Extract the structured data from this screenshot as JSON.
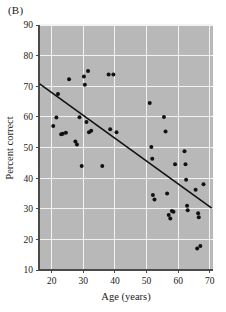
{
  "figure": {
    "panel_label": "(B)",
    "background_color": "#ffffff",
    "plot_background_color": "#b8b8b8",
    "grid_color": "#f2f2f2",
    "point_color": "#111111",
    "line_color": "#111111"
  },
  "chart_data": {
    "type": "scatter",
    "title": "(B)",
    "xlabel": "Age (years)",
    "ylabel": "Percent correct",
    "xlim": [
      16,
      71
    ],
    "ylim": [
      10,
      90
    ],
    "xticks": [
      20,
      30,
      40,
      50,
      60,
      70
    ],
    "yticks": [
      10,
      20,
      30,
      40,
      50,
      60,
      70,
      80,
      90
    ],
    "xtick_labels": [
      "20",
      "30",
      "40",
      "50",
      "60",
      "70"
    ],
    "ytick_labels": [
      "10",
      "20",
      "30",
      "40",
      "50",
      "60",
      "70",
      "80",
      "90"
    ],
    "grid": true,
    "legend": null,
    "x": [
      20.5,
      21.5,
      22.0,
      23.0,
      23.5,
      24.5,
      25.5,
      27.5,
      28.0,
      28.8,
      29.5,
      30.2,
      30.5,
      31.0,
      31.5,
      31.8,
      32.5,
      36.0,
      38.0,
      38.5,
      39.5,
      40.5,
      51.0,
      51.5,
      51.8,
      52.0,
      52.5,
      55.5,
      56.0,
      56.5,
      57.0,
      57.5,
      58.0,
      58.5,
      59.0,
      62.0,
      62.3,
      62.5,
      62.8,
      63.0,
      65.5,
      66.0,
      66.3,
      66.5,
      67.0,
      68.0
    ],
    "y": [
      57.0,
      59.8,
      67.5,
      54.3,
      54.5,
      54.8,
      72.3,
      52.0,
      51.0,
      59.9,
      44.0,
      73.2,
      70.5,
      58.3,
      75.0,
      55.0,
      55.5,
      44.0,
      73.8,
      56.0,
      73.8,
      55.0,
      64.5,
      50.2,
      46.3,
      34.5,
      33.0,
      60.0,
      55.2,
      35.0,
      28.0,
      26.8,
      29.3,
      29.0,
      44.5,
      48.8,
      44.5,
      39.5,
      31.0,
      29.5,
      36.2,
      17.0,
      28.5,
      27.2,
      17.8,
      38.0
    ],
    "n_points": 46,
    "regression_line": {
      "x_start": 16.2,
      "y_start": 70.8,
      "x_end": 70.6,
      "y_end": 30.2,
      "description": "negative linear trend line"
    }
  }
}
